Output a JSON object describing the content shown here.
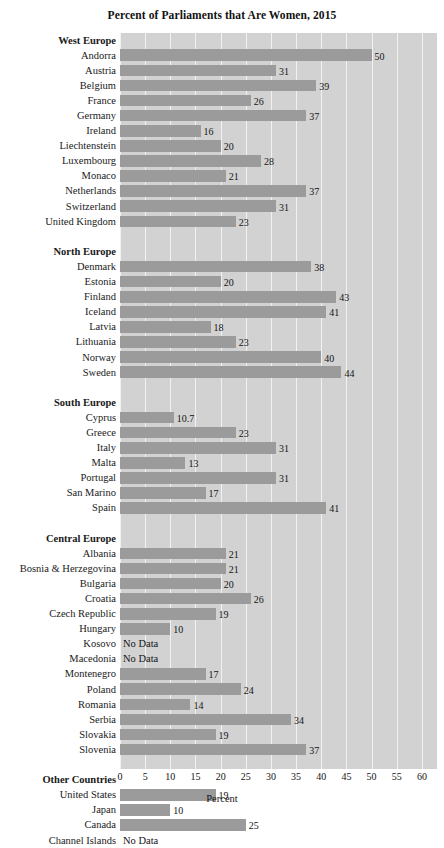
{
  "chart_data": {
    "type": "bar",
    "orientation": "horizontal",
    "title": "Percent of Parliaments that Are Women, 2015",
    "xlabel": "Percent",
    "ylabel": "",
    "xlim": [
      0,
      63
    ],
    "xticks": [
      0,
      5,
      10,
      15,
      20,
      25,
      30,
      35,
      40,
      45,
      50,
      55,
      60
    ],
    "grid": "vertical-white-gridlines",
    "legend": "none",
    "no_data_label": "No Data",
    "bar_color": "#9b9b9b",
    "plot_background": "#d2d2d2",
    "gridline_color": "#f2f2f2",
    "groups": [
      {
        "name": "West Europe",
        "rows": [
          {
            "label": "Andorra",
            "value": 50,
            "display": "50"
          },
          {
            "label": "Austria",
            "value": 31,
            "display": "31"
          },
          {
            "label": "Belgium",
            "value": 39,
            "display": "39"
          },
          {
            "label": "France",
            "value": 26,
            "display": "26"
          },
          {
            "label": "Germany",
            "value": 37,
            "display": "37"
          },
          {
            "label": "Ireland",
            "value": 16,
            "display": "16"
          },
          {
            "label": "Liechtenstein",
            "value": 20,
            "display": "20"
          },
          {
            "label": "Luxembourg",
            "value": 28,
            "display": "28"
          },
          {
            "label": "Monaco",
            "value": 21,
            "display": "21"
          },
          {
            "label": "Netherlands",
            "value": 37,
            "display": "37"
          },
          {
            "label": "Switzerland",
            "value": 31,
            "display": "31"
          },
          {
            "label": "United Kingdom",
            "value": 23,
            "display": "23"
          }
        ]
      },
      {
        "name": "North Europe",
        "rows": [
          {
            "label": "Denmark",
            "value": 38,
            "display": "38"
          },
          {
            "label": "Estonia",
            "value": 20,
            "display": "20"
          },
          {
            "label": "Finland",
            "value": 43,
            "display": "43"
          },
          {
            "label": "Iceland",
            "value": 41,
            "display": "41"
          },
          {
            "label": "Latvia",
            "value": 18,
            "display": "18"
          },
          {
            "label": "Lithuania",
            "value": 23,
            "display": "23"
          },
          {
            "label": "Norway",
            "value": 40,
            "display": "40"
          },
          {
            "label": "Sweden",
            "value": 44,
            "display": "44"
          }
        ]
      },
      {
        "name": "South Europe",
        "rows": [
          {
            "label": "Cyprus",
            "value": 10.7,
            "display": "10.7"
          },
          {
            "label": "Greece",
            "value": 23,
            "display": "23"
          },
          {
            "label": "Italy",
            "value": 31,
            "display": "31"
          },
          {
            "label": "Malta",
            "value": 13,
            "display": "13"
          },
          {
            "label": "Portugal",
            "value": 31,
            "display": "31"
          },
          {
            "label": "San Marino",
            "value": 17,
            "display": "17"
          },
          {
            "label": "Spain",
            "value": 41,
            "display": "41"
          }
        ]
      },
      {
        "name": "Central Europe",
        "rows": [
          {
            "label": "Albania",
            "value": 21,
            "display": "21"
          },
          {
            "label": "Bosnia & Herzegovina",
            "value": 21,
            "display": "21"
          },
          {
            "label": "Bulgaria",
            "value": 20,
            "display": "20"
          },
          {
            "label": "Croatia",
            "value": 26,
            "display": "26"
          },
          {
            "label": "Czech Republic",
            "value": 19,
            "display": "19"
          },
          {
            "label": "Hungary",
            "value": 10,
            "display": "10"
          },
          {
            "label": "Kosovo",
            "value": null,
            "display": "No Data"
          },
          {
            "label": "Macedonia",
            "value": null,
            "display": "No Data"
          },
          {
            "label": "Montenegro",
            "value": 17,
            "display": "17"
          },
          {
            "label": "Poland",
            "value": 24,
            "display": "24"
          },
          {
            "label": "Romania",
            "value": 14,
            "display": "14"
          },
          {
            "label": "Serbia",
            "value": 34,
            "display": "34"
          },
          {
            "label": "Slovakia",
            "value": 19,
            "display": "19"
          },
          {
            "label": "Slovenia",
            "value": 37,
            "display": "37"
          }
        ]
      },
      {
        "name": "Other Countries",
        "rows": [
          {
            "label": "United States",
            "value": 19,
            "display": "19"
          },
          {
            "label": "Japan",
            "value": 10,
            "display": "10"
          },
          {
            "label": "Canada",
            "value": 25,
            "display": "25"
          },
          {
            "label": "Channel Islands",
            "value": null,
            "display": "No Data"
          }
        ]
      }
    ]
  }
}
